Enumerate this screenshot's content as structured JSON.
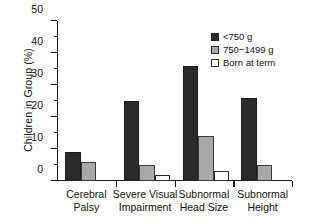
{
  "chart_data": {
    "type": "bar",
    "title": "",
    "xlabel": "",
    "ylabel": "Children in Group (%)",
    "ylim": [
      0,
      50
    ],
    "ytick_labels": [
      "0",
      "10",
      "20",
      "30",
      "40",
      "50"
    ],
    "ytick_values": [
      0,
      10,
      20,
      30,
      40,
      50
    ],
    "yminor_interval": 5,
    "grid": false,
    "legend_position": "upper right",
    "categories": [
      "Cerebral Palsy",
      "Severe Visual Impairment",
      "Subnormal Head Size",
      "Subnormal Height"
    ],
    "category_lines": [
      [
        "Cerebral",
        "Palsy"
      ],
      [
        "Severe Visual",
        "Impairment"
      ],
      [
        "Subnormal",
        "Head Size"
      ],
      [
        "Subnormal",
        "Height"
      ]
    ],
    "series": [
      {
        "name": "<750 g",
        "color": "#2b2b2b",
        "values": [
          9,
          25,
          36,
          26
        ]
      },
      {
        "name": "750−1499 g",
        "color": "#a8a8a8",
        "values": [
          6,
          5,
          14,
          5
        ]
      },
      {
        "name": "Born at term",
        "color": "#ffffff",
        "values": [
          0,
          2,
          3,
          0
        ]
      }
    ]
  },
  "legend": {
    "items": [
      {
        "label": "<750 g"
      },
      {
        "label": "750−1499 g"
      },
      {
        "label": "Born at term"
      }
    ]
  }
}
